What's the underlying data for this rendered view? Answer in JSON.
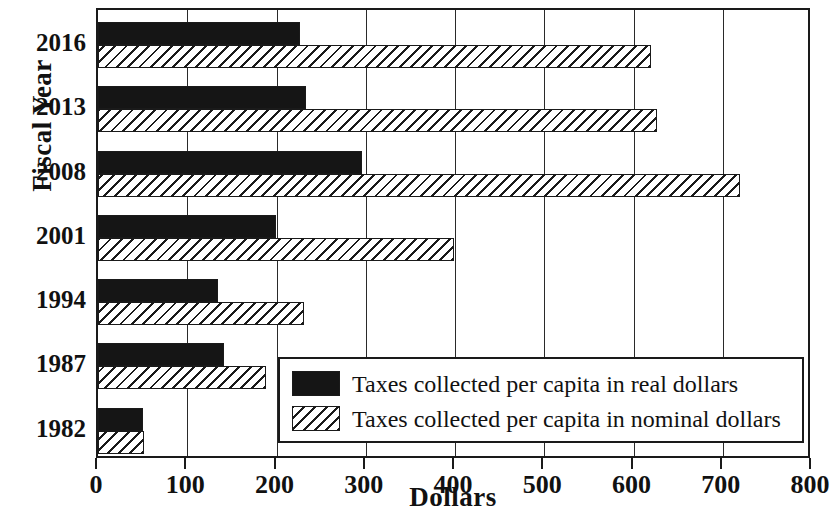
{
  "chart_data": {
    "type": "bar",
    "orientation": "horizontal",
    "title": "",
    "xlabel": "Dollars",
    "ylabel": "Fiscal Year",
    "categories": [
      "2016",
      "2013",
      "2008",
      "2001",
      "1994",
      "1987",
      "1982"
    ],
    "series": [
      {
        "name": "Taxes collected per capita in real dollars",
        "pattern": "solid-black",
        "values": [
          226,
          233,
          296,
          199,
          135,
          141,
          50
        ]
      },
      {
        "name": "Taxes collected per capita in nominal dollars",
        "pattern": "diagonal-hatch",
        "values": [
          620,
          626,
          719,
          399,
          231,
          188,
          52
        ]
      }
    ],
    "xlim": [
      0,
      800
    ],
    "xticks": [
      0,
      100,
      200,
      300,
      400,
      500,
      600,
      700,
      800
    ],
    "xtick_labels": [
      "0",
      "100",
      "200",
      "300",
      "400",
      "500",
      "600",
      "700",
      "800"
    ],
    "grid": "vertical",
    "legend_position": "inside-bottom-right"
  },
  "axes": {
    "y_title": "Fiscal Year",
    "x_title": "Dollars"
  },
  "legend": {
    "entries": [
      {
        "label": "Taxes collected per capita in real dollars",
        "swatch": "solid-black-swatch"
      },
      {
        "label": "Taxes collected per capita in nominal dollars",
        "swatch": "hatched-swatch"
      }
    ]
  }
}
